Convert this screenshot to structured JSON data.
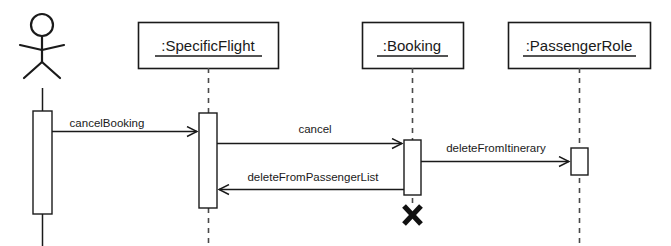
{
  "diagram": {
    "type": "uml-sequence-diagram",
    "title": "",
    "background_color": "#ffffff",
    "line_color": "#1a1a1a",
    "lifeline_color": "#4a4a4a"
  },
  "participants": [
    {
      "id": "actor",
      "label": "",
      "kind": "actor",
      "icon": "stick-figure-actor-icon",
      "center_x": 42
    },
    {
      "id": "specific-flight",
      "label": ":SpecificFlight",
      "kind": "object",
      "center_x": 208
    },
    {
      "id": "booking",
      "label": ":Booking",
      "kind": "object",
      "center_x": 412
    },
    {
      "id": "passenger-role",
      "label": ":PassengerRole",
      "kind": "object",
      "center_x": 579
    }
  ],
  "messages": [
    {
      "order": 1,
      "label": "cancelBooking",
      "from": "actor",
      "to": "specific-flight",
      "direction": "right",
      "kind": "call"
    },
    {
      "order": 2,
      "label": "cancel",
      "from": "specific-flight",
      "to": "booking",
      "direction": "right",
      "kind": "call"
    },
    {
      "order": 3,
      "label": "deleteFromItinerary",
      "from": "booking",
      "to": "passenger-role",
      "direction": "right",
      "kind": "call"
    },
    {
      "order": 4,
      "label": "deleteFromPassengerList",
      "from": "booking",
      "to": "specific-flight",
      "direction": "left",
      "kind": "call"
    }
  ],
  "destruction": {
    "target": "booking",
    "marker": "x-destruction-icon"
  }
}
